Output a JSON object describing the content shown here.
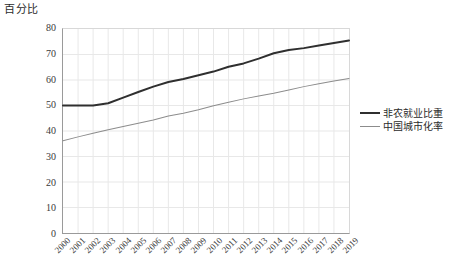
{
  "chart_data": {
    "type": "line",
    "title": "",
    "ylabel": "百分比",
    "xlabel": "",
    "ylim": [
      0,
      80
    ],
    "ytick_step": 10,
    "yticks": [
      "0",
      "10",
      "20",
      "30",
      "40",
      "50",
      "60",
      "70",
      "80"
    ],
    "grid": true,
    "legend_position": "right",
    "categories": [
      "2000",
      "2001",
      "2002",
      "2003",
      "2004",
      "2005",
      "2006",
      "2007",
      "2008",
      "2009",
      "2010",
      "2011",
      "2012",
      "2013",
      "2014",
      "2015",
      "2016",
      "2017",
      "2018",
      "2019"
    ],
    "series": [
      {
        "name": "非农就业比重",
        "color": "#2f2f2f",
        "width": 2,
        "values": [
          50.0,
          50.0,
          50.0,
          50.9,
          53.1,
          55.3,
          57.4,
          59.2,
          60.4,
          61.9,
          63.3,
          65.2,
          66.5,
          68.4,
          70.5,
          71.8,
          72.5,
          73.5,
          74.5,
          75.5
        ]
      },
      {
        "name": "中国城市化率",
        "color": "#8c8c8c",
        "width": 1,
        "values": [
          36.2,
          37.7,
          39.1,
          40.5,
          41.8,
          43.0,
          44.3,
          45.9,
          47.0,
          48.3,
          49.9,
          51.3,
          52.6,
          53.7,
          54.8,
          56.1,
          57.4,
          58.5,
          59.6,
          60.6
        ]
      }
    ]
  },
  "legend": {
    "items": [
      {
        "label": "非农就业比重"
      },
      {
        "label": "中国城市化率"
      }
    ]
  }
}
